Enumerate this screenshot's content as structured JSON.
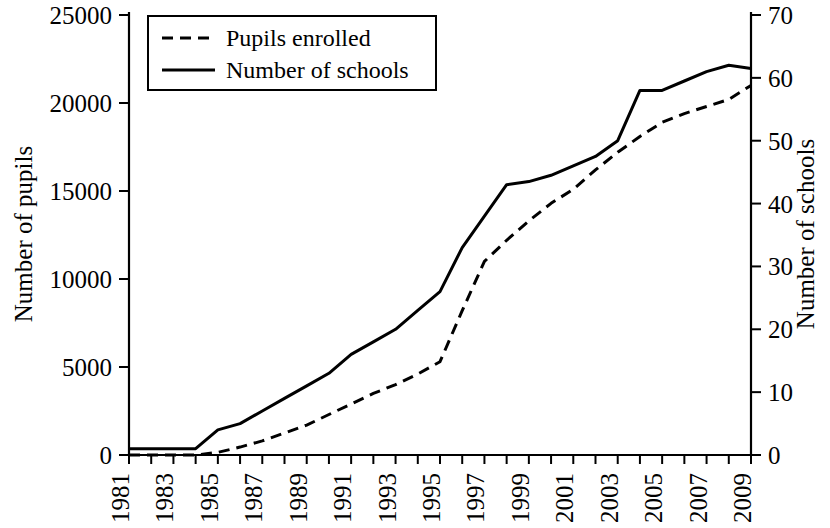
{
  "chart_data": {
    "type": "line",
    "title": "",
    "xlabel": "",
    "ylabel": "Number of pupils",
    "y2label": "Number of schools",
    "grid": false,
    "legend_position": "top-left",
    "xlim": [
      1981,
      2009
    ],
    "ylim": [
      0,
      25000
    ],
    "y2lim": [
      0,
      70
    ],
    "x": [
      1981,
      1982,
      1983,
      1984,
      1985,
      1986,
      1987,
      1988,
      1989,
      1990,
      1991,
      1992,
      1993,
      1994,
      1995,
      1996,
      1997,
      1998,
      1999,
      2000,
      2001,
      2002,
      2003,
      2004,
      2005,
      2006,
      2007,
      2008,
      2009
    ],
    "xticks": [
      "1981",
      "1983",
      "1985",
      "1987",
      "1989",
      "1991",
      "1993",
      "1995",
      "1997",
      "1999",
      "2001",
      "2003",
      "2005",
      "2007",
      "2009"
    ],
    "yticks": [
      "0",
      "5000",
      "10000",
      "15000",
      "20000",
      "25000"
    ],
    "y2ticks": [
      "0",
      "10",
      "20",
      "30",
      "40",
      "50",
      "60",
      "70"
    ],
    "series": [
      {
        "name": "Pupils enrolled",
        "axis": "left",
        "style": "dashed",
        "units": "pupils",
        "values": [
          0,
          0,
          0,
          0,
          150,
          450,
          800,
          1250,
          1700,
          2300,
          2900,
          3500,
          4000,
          4600,
          5300,
          8200,
          11000,
          12200,
          13300,
          14300,
          15100,
          16200,
          17200,
          18100,
          18900,
          19400,
          19800,
          20200,
          21000
        ]
      },
      {
        "name": "Number of schools",
        "axis": "right",
        "style": "solid",
        "units": "schools",
        "values": [
          1,
          1,
          1,
          1,
          4,
          5,
          7,
          9,
          11,
          13,
          16,
          18,
          20,
          23,
          26,
          33,
          38,
          43,
          43.5,
          44.5,
          46,
          47.5,
          50,
          58,
          58,
          59.5,
          61,
          62,
          61.5
        ]
      }
    ],
    "legend": [
      {
        "label": "Pupils enrolled",
        "style": "dashed"
      },
      {
        "label": "Number of schools",
        "style": "solid"
      }
    ],
    "colors": {
      "line": "#000000",
      "background": "#ffffff",
      "axis": "#000000"
    }
  }
}
